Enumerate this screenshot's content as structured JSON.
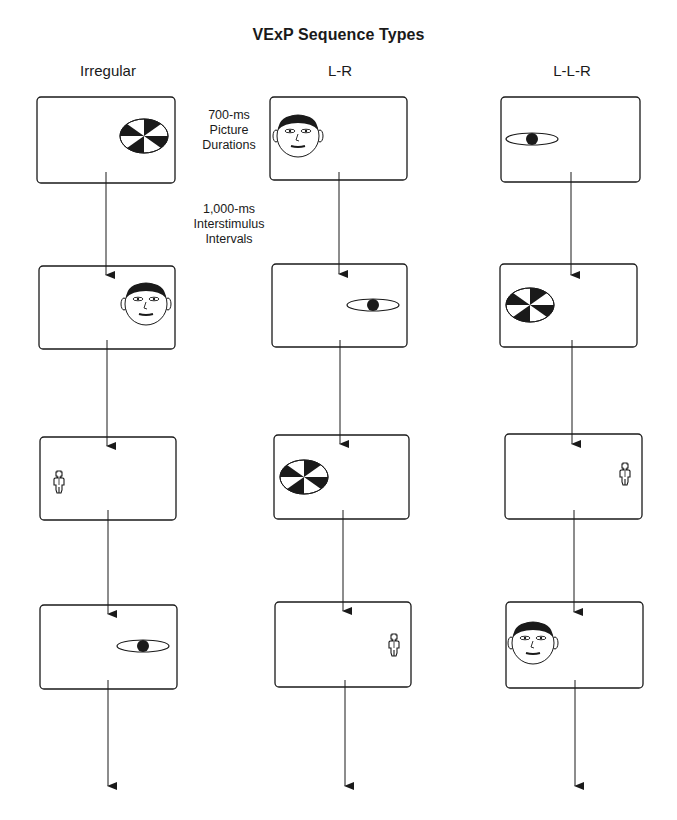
{
  "title": "VExP Sequence Types",
  "columns": [
    {
      "label": "Irregular",
      "panels": [
        {
          "stimulus": "checkerboard",
          "position": "right"
        },
        {
          "stimulus": "face",
          "position": "right"
        },
        {
          "stimulus": "figure",
          "position": "left"
        },
        {
          "stimulus": "eye",
          "position": "right"
        }
      ]
    },
    {
      "label": "L-R",
      "panels": [
        {
          "stimulus": "face",
          "position": "left"
        },
        {
          "stimulus": "eye",
          "position": "right"
        },
        {
          "stimulus": "checkerboard",
          "position": "left"
        },
        {
          "stimulus": "figure",
          "position": "right"
        }
      ]
    },
    {
      "label": "L-L-R",
      "panels": [
        {
          "stimulus": "eye",
          "position": "left"
        },
        {
          "stimulus": "checkerboard",
          "position": "left"
        },
        {
          "stimulus": "figure",
          "position": "right"
        },
        {
          "stimulus": "face",
          "position": "left"
        }
      ]
    }
  ],
  "annotations": {
    "picture_duration": "700-ms\nPicture\nDurations",
    "picture_duration_lines": [
      "700-ms",
      "Picture",
      "Durations"
    ],
    "isi_lines": [
      "1,000-ms",
      "Interstimulus",
      "Intervals"
    ]
  },
  "colors": {
    "ink": "#1a1a1a",
    "background": "#ffffff"
  }
}
